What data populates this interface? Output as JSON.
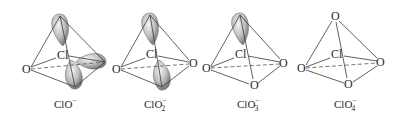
{
  "figure": {
    "structures": [
      {
        "formula_base": "ClO",
        "subscript": "",
        "charge": "−",
        "center_atom": "Cl",
        "oxygen_labels": [
          "O"
        ],
        "lone_pairs": 3
      },
      {
        "formula_base": "ClO",
        "subscript": "2",
        "charge": "−",
        "center_atom": "Cl",
        "oxygen_labels": [
          "O",
          "O"
        ],
        "lone_pairs": 2
      },
      {
        "formula_base": "ClO",
        "subscript": "3",
        "charge": "−",
        "center_atom": "Cl",
        "oxygen_labels": [
          "O",
          "O",
          "O"
        ],
        "lone_pairs": 1
      },
      {
        "formula_base": "ClO",
        "subscript": "4",
        "charge": "−",
        "center_atom": "Cl",
        "oxygen_labels": [
          "O",
          "O",
          "O",
          "O"
        ],
        "lone_pairs": 0
      }
    ]
  }
}
